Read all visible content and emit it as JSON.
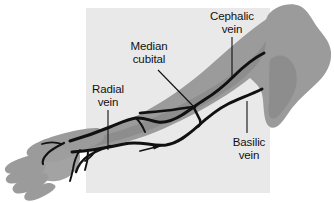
{
  "figure": {
    "panel_color": "#e9e9e9",
    "arm_color": "#9b9b9b",
    "arm_shade_color": "#8d8d8d",
    "palm_color": "#a3a3a3",
    "vein_color": "#111111",
    "background_color": "#ffffff",
    "outline_color": "#2a2a2a"
  },
  "labels": [
    {
      "id": "cephalic-vein",
      "line1": "Cephalic",
      "line2": "vein",
      "x": 198,
      "y": 10,
      "width": 68,
      "leader": {
        "type": "line",
        "x1": 232,
        "y1": 37,
        "x2": 232,
        "y2": 78
      }
    },
    {
      "id": "median-cubital",
      "line1": "Median",
      "line2": "cubital",
      "x": 118,
      "y": 40,
      "width": 62,
      "leader": {
        "type": "line",
        "x1": 158,
        "y1": 70,
        "x2": 195,
        "y2": 108
      }
    },
    {
      "id": "radial-vein",
      "line1": "Radial",
      "line2": "vein",
      "x": 79,
      "y": 83,
      "width": 58,
      "leader": {
        "type": "line",
        "x1": 108,
        "y1": 110,
        "x2": 108,
        "y2": 150
      }
    },
    {
      "id": "basilic-vein",
      "line1": "Basilic",
      "line2": "vein",
      "x": 220,
      "y": 136,
      "width": 58,
      "leader": {
        "type": "line",
        "x1": 247,
        "y1": 101,
        "x2": 247,
        "y2": 133
      }
    }
  ],
  "panel": {
    "x": 86,
    "y": 8,
    "width": 184,
    "height": 185
  },
  "structures": {
    "cephalic_vein": "lateral superficial vein running up the radial side of the forearm and arm",
    "basilic_vein": "medial superficial vein running up the ulnar side of the forearm and arm",
    "median_cubital_vein": "oblique connecting vein in the cubital fossa joining cephalic to basilic",
    "radial_vein": "deep vein of the lateral forearm",
    "dorsal_venous_network": "vein network on the dorsum of the hand"
  },
  "flow_arrow": {
    "present": true,
    "direction": "toward-shoulder",
    "x": 158,
    "y": 147
  }
}
